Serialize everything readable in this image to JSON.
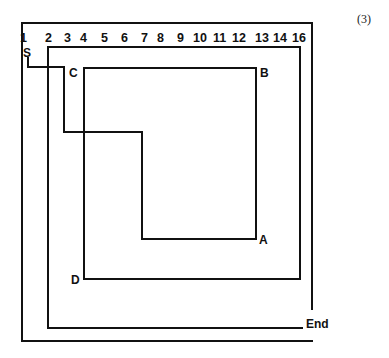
{
  "figure_number": "(3)",
  "column_numbers": [
    {
      "label": "1",
      "x": 20
    },
    {
      "label": "2",
      "x": 45
    },
    {
      "label": "3",
      "x": 65
    },
    {
      "label": "4",
      "x": 81
    },
    {
      "label": "5",
      "x": 102
    },
    {
      "label": "6",
      "x": 122
    },
    {
      "label": "7",
      "x": 142
    },
    {
      "label": "8",
      "x": 157
    },
    {
      "label": "9",
      "x": 177
    },
    {
      "label": "10",
      "x": 194
    },
    {
      "label": "11",
      "x": 213
    },
    {
      "label": "12",
      "x": 232
    },
    {
      "label": "13",
      "x": 255
    },
    {
      "label": "14",
      "x": 273
    },
    {
      "label": "16",
      "x": 292
    }
  ],
  "points": {
    "start": "S",
    "a": "A",
    "b": "B",
    "c": "C",
    "d": "D",
    "end": "End"
  },
  "paths": {
    "outer_frame": "M312,309 L312,23 L22,23 L22,341 L312,341",
    "path_s_to_a": "M28,58 L28,67 L64,67 L64,132 L142,132 L142,239 L256,239 L256,68 L84,68 L84,279 L300,279 L300,47 L48,47 L48,328 L302,328"
  }
}
